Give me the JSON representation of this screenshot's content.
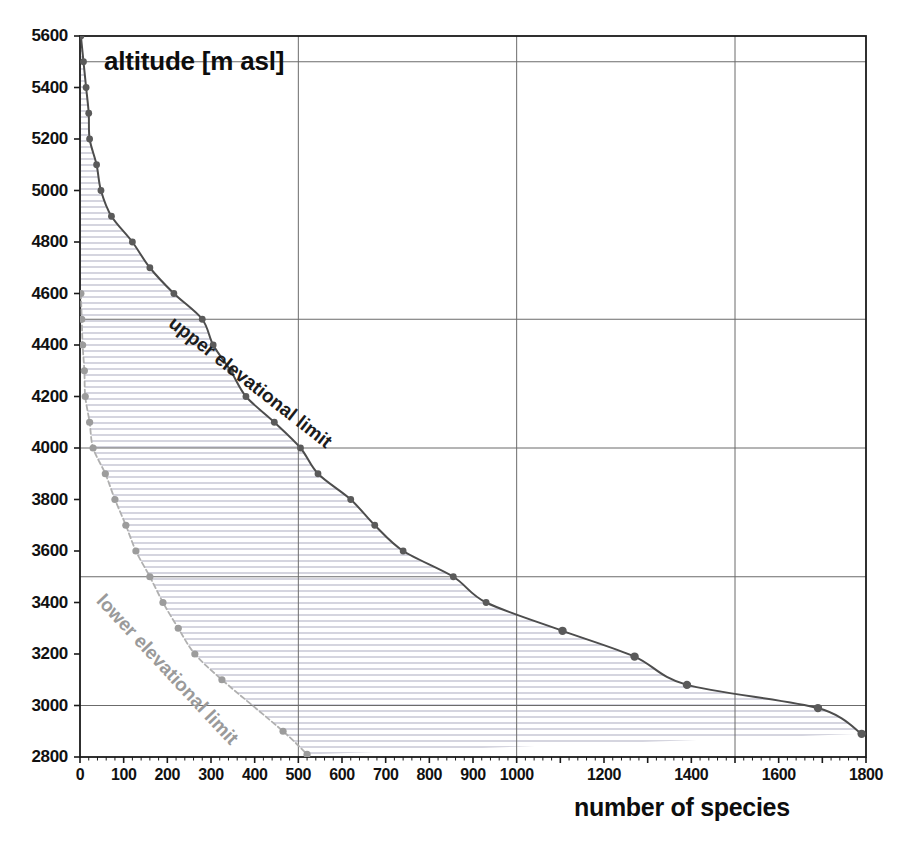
{
  "chart_data": {
    "type": "line",
    "title": "altitude [m asl]",
    "xlabel": "number of species",
    "ylabel": "altitude [m asl]",
    "xlim": [
      0,
      1800
    ],
    "ylim": [
      2800,
      5600
    ],
    "grid": true,
    "legend_position": "inline-annotation",
    "x_ticks": [
      0,
      100,
      200,
      300,
      400,
      500,
      600,
      700,
      800,
      900,
      1000,
      1200,
      1400,
      1600,
      1800
    ],
    "x_tick_labels": [
      "0",
      "100",
      "200",
      "300",
      "400",
      "500",
      "600",
      "700",
      "800",
      "900",
      "1000",
      "1200",
      "1400",
      "1600",
      "1800"
    ],
    "y_ticks": [
      2800,
      3000,
      3200,
      3400,
      3600,
      3800,
      4000,
      4200,
      4400,
      4600,
      4800,
      5000,
      5200,
      5400,
      5600
    ],
    "y_tick_labels": [
      "2800",
      "3000",
      "3200",
      "3400",
      "3600",
      "3800",
      "4000",
      "4200",
      "4400",
      "4600",
      "4800",
      "5000",
      "5200",
      "5400",
      "5600"
    ],
    "x_gridlines": [
      500,
      1000,
      1500
    ],
    "y_gridlines": [
      3000,
      3500,
      4000,
      4500,
      5500
    ],
    "fill_between": true,
    "fill_style": "horizontal-hatch",
    "series": [
      {
        "name": "upper elevational limit",
        "color": "#4d4d4d",
        "marker_color": "#5a5a5a",
        "line_style": "solid",
        "points": [
          {
            "x": 2,
            "y": 5600
          },
          {
            "x": 8,
            "y": 5500
          },
          {
            "x": 14,
            "y": 5400
          },
          {
            "x": 20,
            "y": 5300
          },
          {
            "x": 22,
            "y": 5200
          },
          {
            "x": 38,
            "y": 5100
          },
          {
            "x": 48,
            "y": 5000
          },
          {
            "x": 72,
            "y": 4900
          },
          {
            "x": 120,
            "y": 4800
          },
          {
            "x": 160,
            "y": 4700
          },
          {
            "x": 215,
            "y": 4600
          },
          {
            "x": 280,
            "y": 4500
          },
          {
            "x": 305,
            "y": 4400
          },
          {
            "x": 345,
            "y": 4300
          },
          {
            "x": 380,
            "y": 4200
          },
          {
            "x": 445,
            "y": 4100
          },
          {
            "x": 505,
            "y": 4000
          },
          {
            "x": 545,
            "y": 3900
          },
          {
            "x": 620,
            "y": 3800
          },
          {
            "x": 675,
            "y": 3700
          },
          {
            "x": 740,
            "y": 3600
          },
          {
            "x": 855,
            "y": 3500
          },
          {
            "x": 930,
            "y": 3400
          },
          {
            "x": 1105,
            "y": 3290
          },
          {
            "x": 1270,
            "y": 3190
          },
          {
            "x": 1390,
            "y": 3080
          },
          {
            "x": 1690,
            "y": 2990
          },
          {
            "x": 1790,
            "y": 2890
          }
        ]
      },
      {
        "name": "lower elevational limit",
        "color": "#b0b0b0",
        "marker_color": "#9c9c9c",
        "line_style": "dashed",
        "points": [
          {
            "x": 2,
            "y": 4600
          },
          {
            "x": 4,
            "y": 4500
          },
          {
            "x": 6,
            "y": 4400
          },
          {
            "x": 10,
            "y": 4300
          },
          {
            "x": 12,
            "y": 4200
          },
          {
            "x": 22,
            "y": 4100
          },
          {
            "x": 30,
            "y": 4000
          },
          {
            "x": 58,
            "y": 3900
          },
          {
            "x": 80,
            "y": 3800
          },
          {
            "x": 105,
            "y": 3700
          },
          {
            "x": 128,
            "y": 3600
          },
          {
            "x": 160,
            "y": 3500
          },
          {
            "x": 190,
            "y": 3400
          },
          {
            "x": 225,
            "y": 3300
          },
          {
            "x": 263,
            "y": 3200
          },
          {
            "x": 325,
            "y": 3100
          },
          {
            "x": 465,
            "y": 2900
          },
          {
            "x": 520,
            "y": 2810
          }
        ]
      }
    ],
    "annotations": [
      {
        "text": "upper elevational limit",
        "color": "#1c1c1c"
      },
      {
        "text": "lower elevational limit",
        "color": "#9a9a9a"
      }
    ]
  },
  "colors": {
    "frame": "#1a1a1a",
    "grid": "#6b6b6b",
    "hatch": "#c9c9d6",
    "upper": "#4d4d4d",
    "lower": "#b0b0b0",
    "text": "#111111"
  }
}
